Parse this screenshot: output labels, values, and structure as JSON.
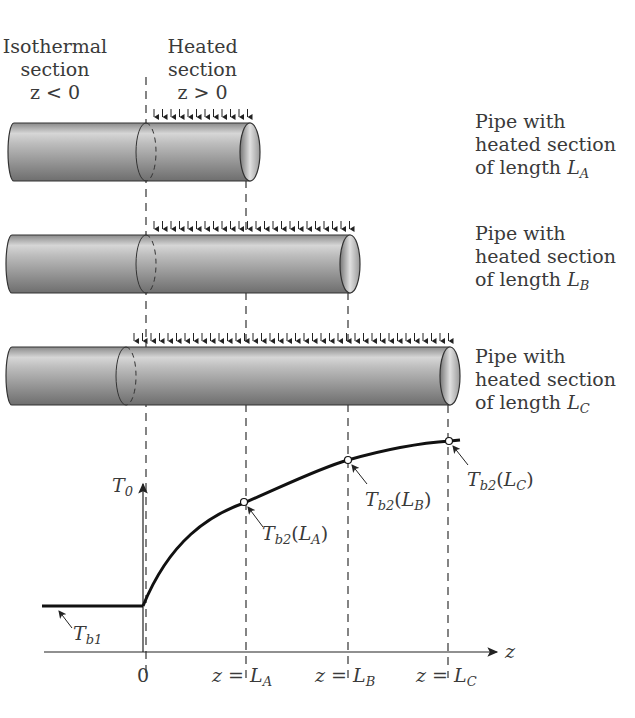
{
  "header": {
    "isothermal": {
      "line1": "Isothermal",
      "line2": "section",
      "line3": "z < 0"
    },
    "heated": {
      "line1": "Heated",
      "line2": "section",
      "line3": "z > 0"
    }
  },
  "pipes": [
    {
      "line1": "Pipe with",
      "line2": "heated section",
      "line3": "of length ",
      "sym": "L",
      "sub": "A"
    },
    {
      "line1": "Pipe with",
      "line2": "heated section",
      "line3": "of length ",
      "sym": "L",
      "sub": "B"
    },
    {
      "line1": "Pipe with",
      "line2": "heated section",
      "line3": "of length ",
      "sym": "L",
      "sub": "C"
    }
  ],
  "graph": {
    "y_axis_label": {
      "sym": "T",
      "sub": "0"
    },
    "x_axis_label": "z",
    "inlet_label": {
      "sym": "T",
      "sub": "b1"
    },
    "ticks": [
      {
        "text": "0"
      },
      {
        "pre": "z = ",
        "sym": "L",
        "sub": "A"
      },
      {
        "pre": "z = ",
        "sym": "L",
        "sub": "B"
      },
      {
        "pre": "z = ",
        "sym": "L",
        "sub": "C"
      }
    ],
    "points": [
      {
        "sym": "T",
        "sub": "b2",
        "arg": "L",
        "argsub": "A"
      },
      {
        "sym": "T",
        "sub": "b2",
        "arg": "L",
        "argsub": "B"
      },
      {
        "sym": "T",
        "sub": "b2",
        "arg": "L",
        "argsub": "C"
      }
    ]
  }
}
